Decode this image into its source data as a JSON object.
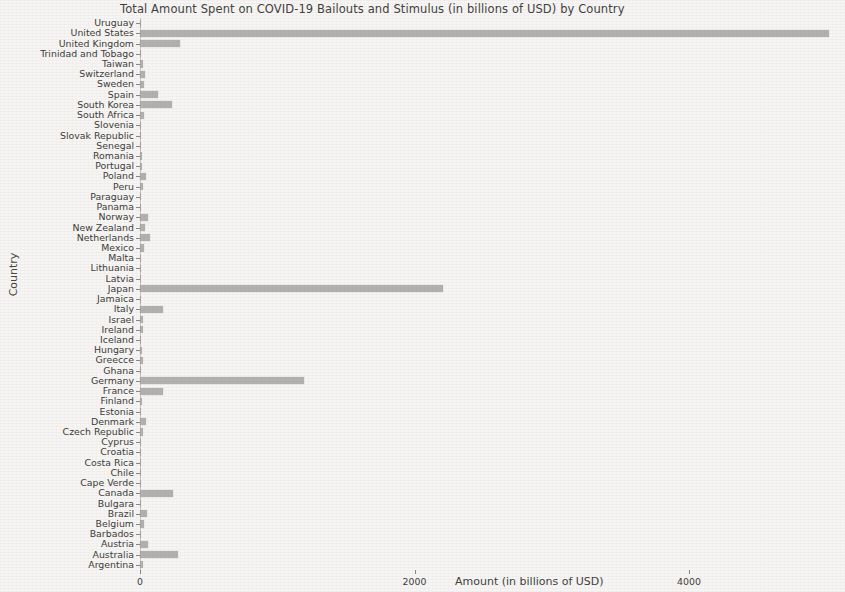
{
  "chart_data": {
    "type": "bar",
    "orientation": "horizontal",
    "title": "Total Amount Spent on COVID-19 Bailouts and Stimulus (in billions of USD) by Country",
    "xlabel": "Amount (in billions of USD)",
    "ylabel": "Country",
    "xlim": [
      0,
      5100
    ],
    "xticks": [
      0,
      2000,
      4000
    ],
    "xtick_labels": [
      "0",
      "2000",
      "4000"
    ],
    "grid": false,
    "legend": null,
    "bar_color": "#9e9d9b",
    "background_color": "#f6f5f3",
    "categories": [
      "Uruguay",
      "United States",
      "United Kingdom",
      "Trinidad and Tobago",
      "Taiwan",
      "Switzerland",
      "Sweden",
      "Spain",
      "South Korea",
      "South Africa",
      "Slovenia",
      "Slovak Republic",
      "Senegal",
      "Romania",
      "Portugal",
      "Poland",
      "Peru",
      "Paraguay",
      "Panama",
      "Norway",
      "New Zealand",
      "Netherlands",
      "Mexico",
      "Malta",
      "Lithuania",
      "Latvia",
      "Japan",
      "Jamaica",
      "Italy",
      "Israel",
      "Ireland",
      "Iceland",
      "Hungary",
      "Greecce",
      "Ghana",
      "Germany",
      "France",
      "Finland",
      "Estonia",
      "Denmark",
      "Czech Republic",
      "Cyprus",
      "Croatia",
      "Costa Rica",
      "Chile",
      "Cape Verde",
      "Canada",
      "Bulgara",
      "Brazil",
      "Belgium",
      "Barbados",
      "Austria",
      "Australia",
      "Argentina"
    ],
    "values": [
      3,
      5020,
      293,
      2,
      22,
      38,
      30,
      130,
      235,
      26,
      5,
      4,
      2,
      12,
      18,
      45,
      20,
      2,
      3,
      60,
      38,
      70,
      26,
      2,
      4,
      3,
      2210,
      2,
      165,
      22,
      20,
      4,
      18,
      24,
      3,
      1195,
      170,
      18,
      3,
      42,
      24,
      4,
      4,
      3,
      10,
      2,
      240,
      6,
      48,
      32,
      2,
      55,
      280,
      20
    ]
  }
}
